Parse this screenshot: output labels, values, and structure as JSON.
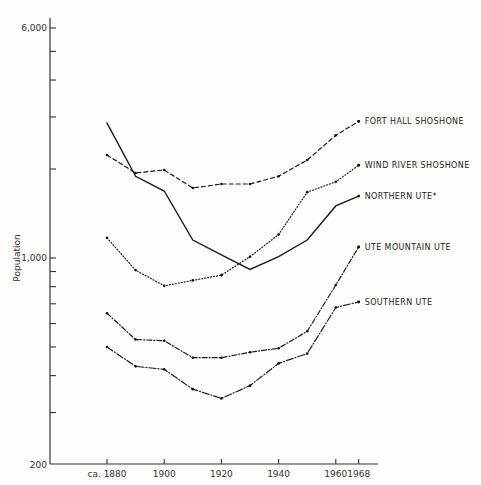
{
  "chart_data": {
    "type": "line",
    "title": "",
    "xlabel": "",
    "ylabel": "Population",
    "yscale": "log",
    "ylim": [
      200,
      6000
    ],
    "y_tick_labels": [
      "6,000",
      "1,000",
      "200"
    ],
    "y_tick_label_values": [
      6000,
      1000,
      200
    ],
    "y_minor_ticks": [
      5000,
      4000,
      3000,
      2000,
      900,
      800,
      700,
      600,
      500,
      400,
      300
    ],
    "x_tick_labels": [
      "ca. 1880",
      "1900",
      "1920",
      "1940",
      "1960",
      "1968"
    ],
    "x_tick_values": [
      1880,
      1900,
      1920,
      1940,
      1960,
      1968
    ],
    "x": [
      1880,
      1890,
      1900,
      1910,
      1920,
      1930,
      1940,
      1950,
      1960,
      1968
    ],
    "grid": false,
    "legend_position": "inline-right",
    "series": [
      {
        "name": "FORT HALL SHOSHONE",
        "style": "dashed",
        "values": [
          2230,
          1940,
          1985,
          1725,
          1780,
          1780,
          1890,
          2145,
          2600,
          2900
        ]
      },
      {
        "name": "WIND RIVER SHOSHONE",
        "style": "dotted",
        "values": [
          1170,
          910,
          805,
          840,
          875,
          1010,
          1200,
          1670,
          1810,
          2060
        ]
      },
      {
        "name": "NORTHERN UTE*",
        "style": "solid",
        "values": [
          2860,
          1890,
          1685,
          1150,
          1025,
          915,
          1010,
          1150,
          1500,
          1620
        ]
      },
      {
        "name": "UTE MOUNTAIN UTE",
        "style": "dash-dot",
        "values": [
          650,
          530,
          525,
          460,
          460,
          480,
          495,
          565,
          810,
          1090
        ]
      },
      {
        "name": "SOUTHERN UTE",
        "style": "long-dash-dot",
        "values": [
          500,
          430,
          420,
          360,
          335,
          370,
          440,
          475,
          680,
          710
        ]
      }
    ]
  }
}
